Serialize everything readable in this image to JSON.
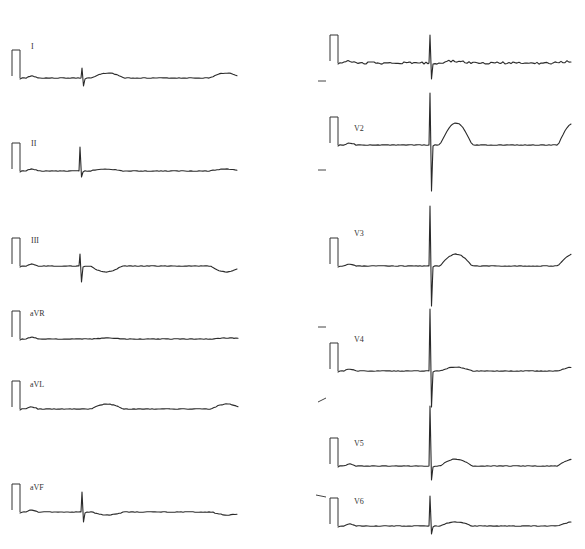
{
  "figure": {
    "type": "12-lead electrocardiogram",
    "width": 585,
    "height": 549,
    "ink_color": "#2a2a2a",
    "background": "#ffffff"
  },
  "leads": [
    {
      "label": "I",
      "column": "left",
      "baseline_y": 78,
      "label_pos": [
        31,
        49
      ],
      "cal_x": 12,
      "start_x": 22,
      "end_x": 238,
      "beats_x": [
        82,
        200
      ],
      "qrs": {
        "up": 10,
        "down": 8
      },
      "t_wave": 5,
      "cal_height": 28
    },
    {
      "label": "II",
      "column": "left",
      "baseline_y": 171,
      "label_pos": [
        31,
        146
      ],
      "cal_x": 12,
      "start_x": 22,
      "end_x": 238,
      "beats_x": [
        80,
        200
      ],
      "qrs": {
        "up": 24,
        "down": 6
      },
      "t_wave": 2,
      "cal_height": 28
    },
    {
      "label": "III",
      "column": "left",
      "baseline_y": 266,
      "label_pos": [
        31,
        243
      ],
      "cal_x": 12,
      "start_x": 22,
      "end_x": 238,
      "beats_x": [
        80,
        200
      ],
      "qrs": {
        "up": 12,
        "down": 16
      },
      "t_wave": -6,
      "cal_height": 28,
      "note": "QRS at second beat tall upright ~35px"
    },
    {
      "label": "aVR",
      "column": "left",
      "baseline_y": 339,
      "label_pos": [
        30,
        316
      ],
      "cal_x": 12,
      "start_x": 22,
      "end_x": 238,
      "beats_x": [
        83,
        203
      ],
      "qrs": {
        "up": 8,
        "down": 14
      },
      "t_wave": 1,
      "cal_height": 28
    },
    {
      "label": "aVL",
      "column": "left",
      "baseline_y": 409,
      "label_pos": [
        30,
        387
      ],
      "cal_x": 12,
      "start_x": 22,
      "end_x": 238,
      "beats_x": [
        81,
        201
      ],
      "qrs": {
        "up": 8,
        "down": 8
      },
      "t_wave": 5,
      "cal_height": 28
    },
    {
      "label": "aVF",
      "column": "left",
      "baseline_y": 512,
      "label_pos": [
        30,
        490
      ],
      "cal_x": 12,
      "start_x": 22,
      "end_x": 238,
      "beats_x": [
        82,
        202
      ],
      "qrs": {
        "up": 20,
        "down": 10
      },
      "t_wave": -3,
      "cal_height": 28
    },
    {
      "label": "V1",
      "column": "right",
      "baseline_y": 63,
      "label_pos": [
        352,
        47
      ],
      "cal_x": 330,
      "start_x": 340,
      "end_x": 572,
      "beats_x": [
        430,
        548
      ],
      "qrs": {
        "up": 28,
        "down": 16
      },
      "t_wave": 2,
      "cal_height": 28,
      "label_visible": false
    },
    {
      "label": "V2",
      "column": "right",
      "baseline_y": 145,
      "label_pos": [
        354,
        131
      ],
      "cal_x": 330,
      "start_x": 340,
      "end_x": 572,
      "beats_x": [
        430,
        548
      ],
      "qrs": {
        "up": 52,
        "down": 46
      },
      "t_wave": 22,
      "cal_height": 28
    },
    {
      "label": "V3",
      "column": "right",
      "baseline_y": 266,
      "label_pos": [
        354,
        236
      ],
      "cal_x": 330,
      "start_x": 340,
      "end_x": 572,
      "beats_x": [
        430,
        548
      ],
      "qrs": {
        "up": 60,
        "down": 40
      },
      "t_wave": 12,
      "cal_height": 28
    },
    {
      "label": "V4",
      "column": "right",
      "baseline_y": 371,
      "label_pos": [
        354,
        342
      ],
      "cal_x": 330,
      "start_x": 340,
      "end_x": 572,
      "beats_x": [
        430,
        548
      ],
      "qrs": {
        "up": 62,
        "down": 36
      },
      "t_wave": 4,
      "cal_height": 28
    },
    {
      "label": "V5",
      "column": "right",
      "baseline_y": 466,
      "label_pos": [
        354,
        446
      ],
      "cal_x": 330,
      "start_x": 340,
      "end_x": 572,
      "beats_x": [
        430,
        548
      ],
      "qrs": {
        "up": 60,
        "down": 14
      },
      "t_wave": 7,
      "cal_height": 28
    },
    {
      "label": "V6",
      "column": "right",
      "baseline_y": 526,
      "label_pos": [
        354,
        504
      ],
      "cal_x": 330,
      "start_x": 340,
      "end_x": 572,
      "beats_x": [
        430,
        548
      ],
      "qrs": {
        "up": 30,
        "down": 8
      },
      "t_wave": 4,
      "cal_height": 28
    }
  ],
  "label_text": {
    "I": "I",
    "II": "II",
    "III": "III",
    "aVR": "aVR",
    "aVL": "aVL",
    "aVF": "aVF",
    "V1": "",
    "V2": "V2",
    "V3": "V3",
    "V4": "V4",
    "V5": "V5",
    "V6": "V6"
  },
  "margin_marks": [
    {
      "x1": 318,
      "y1": 81,
      "x2": 326,
      "y2": 81
    },
    {
      "x1": 318,
      "y1": 170,
      "x2": 326,
      "y2": 170
    },
    {
      "x1": 318,
      "y1": 327,
      "x2": 326,
      "y2": 327
    },
    {
      "x1": 318,
      "y1": 402,
      "x2": 326,
      "y2": 398
    },
    {
      "x1": 316,
      "y1": 495,
      "x2": 326,
      "y2": 497
    }
  ]
}
